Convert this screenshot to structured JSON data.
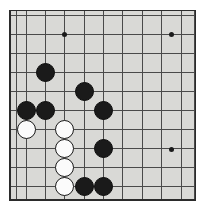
{
  "diagram": {
    "board_type": "go-board",
    "background_color": "#d9d9d6",
    "line_color": "#4a4a4a",
    "border_color": "#2b2b2b",
    "black_stone_color": "#1a1a1a",
    "white_stone_color": "#fbfbfb",
    "image_width": 209,
    "image_height": 211,
    "board_rect": {
      "left": 9,
      "top": 10,
      "width": 187,
      "height": 191
    },
    "grid": {
      "spacing_x": 19.3,
      "spacing_y": 19.2,
      "origin_x": 16,
      "origin_y": 15,
      "columns": 10,
      "rows": 10
    },
    "star_points": [
      {
        "name": "star-top-left",
        "x": 64,
        "y": 34
      },
      {
        "name": "star-top-right",
        "x": 171,
        "y": 34
      },
      {
        "name": "star-bottom-right",
        "x": 171,
        "y": 149
      }
    ],
    "stones": [
      {
        "name": "black-stone-1",
        "color": "black",
        "x": 45,
        "y": 72
      },
      {
        "name": "black-stone-2",
        "color": "black",
        "x": 84,
        "y": 91
      },
      {
        "name": "black-stone-3",
        "color": "black",
        "x": 26,
        "y": 110
      },
      {
        "name": "black-stone-4",
        "color": "black",
        "x": 45,
        "y": 110
      },
      {
        "name": "black-stone-5",
        "color": "black",
        "x": 103,
        "y": 110
      },
      {
        "name": "black-stone-6",
        "color": "black",
        "x": 103,
        "y": 148
      },
      {
        "name": "black-stone-7",
        "color": "black",
        "x": 84,
        "y": 186
      },
      {
        "name": "black-stone-8",
        "color": "black",
        "x": 103,
        "y": 186
      },
      {
        "name": "white-stone-1",
        "color": "white",
        "x": 26,
        "y": 129
      },
      {
        "name": "white-stone-2",
        "color": "white",
        "x": 64,
        "y": 129
      },
      {
        "name": "white-stone-3",
        "color": "white",
        "x": 64,
        "y": 148
      },
      {
        "name": "white-stone-4",
        "color": "white",
        "x": 64,
        "y": 167
      },
      {
        "name": "white-stone-5",
        "color": "white",
        "x": 64,
        "y": 186
      }
    ],
    "vertical_lines": [
      16,
      26,
      45,
      64,
      84,
      103,
      122,
      142,
      161,
      181,
      194
    ],
    "horizontal_lines": [
      15,
      34,
      53,
      72,
      91,
      110,
      129,
      148,
      167,
      186,
      199
    ]
  }
}
